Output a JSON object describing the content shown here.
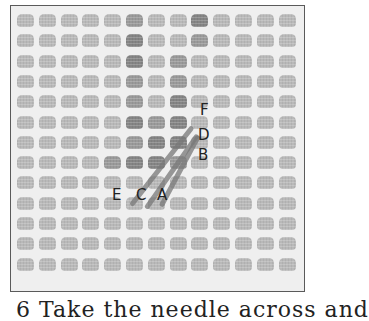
{
  "figure": {
    "grid": {
      "columns": 13,
      "rows": 13
    },
    "colors": {
      "canvas": "#efefef",
      "mesh_blob": "#b9b9b9",
      "stitched": "#858585",
      "frame_border": "#5a5a5a",
      "label_text": "#222222"
    },
    "labels": {
      "f": "F",
      "d": "D",
      "b": "B",
      "e": "E",
      "c": "C",
      "a": "A"
    }
  },
  "caption": {
    "text": "6   Take the needle across and"
  }
}
